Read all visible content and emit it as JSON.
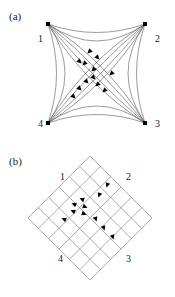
{
  "figure": {
    "background_color": "#ffffff",
    "stroke_color": "#555555",
    "marker_color": "#000000",
    "text_color": "#1a1a1a"
  },
  "panels": [
    {
      "id": "a",
      "caption": "(a)",
      "description": "complete-graph-curved-arcs",
      "node_labels": [
        {
          "name": "1",
          "x": 38,
          "y": 34
        },
        {
          "name": "2",
          "x": 155,
          "y": 34
        },
        {
          "name": "3",
          "x": 155,
          "y": 119
        },
        {
          "name": "4",
          "x": 38,
          "y": 119
        }
      ]
    },
    {
      "id": "b",
      "caption": "(b)",
      "description": "rotated-square-lattice-grid",
      "node_labels": [
        {
          "name": "1",
          "x": 60,
          "y": 24
        },
        {
          "name": "2",
          "x": 126,
          "y": 24
        },
        {
          "name": "3",
          "x": 126,
          "y": 106
        },
        {
          "name": "4",
          "x": 58,
          "y": 106
        }
      ]
    }
  ],
  "chart_data": {
    "type": "diagram",
    "title": "",
    "panel_a": {
      "type": "graph-with-curved-edges",
      "nodes": [
        {
          "id": 1,
          "label": "1",
          "x": 48,
          "y": 24
        },
        {
          "id": 2,
          "label": "2",
          "x": 145,
          "y": 24
        },
        {
          "id": 3,
          "label": "3",
          "x": 145,
          "y": 123
        },
        {
          "id": 4,
          "label": "4",
          "x": 48,
          "y": 123
        }
      ],
      "edge_curvature": 0.34,
      "curve_bundles": [
        {
          "from": 1,
          "to": 3,
          "count": 4
        },
        {
          "from": 2,
          "to": 4,
          "count": 4
        },
        {
          "from": 1,
          "to": 2,
          "count": 2
        },
        {
          "from": 4,
          "to": 3,
          "count": 2
        },
        {
          "from": 1,
          "to": 4,
          "count": 2
        },
        {
          "from": 2,
          "to": 3,
          "count": 2
        }
      ],
      "markers": [
        {
          "x": 91,
          "y": 50,
          "type": "arrowhead"
        },
        {
          "x": 78,
          "y": 60,
          "type": "arrowhead"
        },
        {
          "x": 86,
          "y": 62,
          "type": "arrowhead"
        },
        {
          "x": 96,
          "y": 56,
          "type": "arrowhead"
        },
        {
          "x": 95,
          "y": 68,
          "type": "arrowhead"
        },
        {
          "x": 92,
          "y": 76,
          "type": "arrowhead"
        },
        {
          "x": 85,
          "y": 80,
          "type": "arrowhead"
        },
        {
          "x": 99,
          "y": 83,
          "type": "arrowhead"
        },
        {
          "x": 78,
          "y": 87,
          "type": "arrowhead"
        },
        {
          "x": 106,
          "y": 89,
          "type": "arrowhead"
        },
        {
          "x": 72,
          "y": 95,
          "type": "arrowhead"
        },
        {
          "x": 113,
          "y": 72,
          "type": "arrowhead"
        }
      ]
    },
    "panel_b": {
      "type": "rotated-lattice",
      "center_x": 90,
      "center_y": 70,
      "half_diagonal": 62,
      "divisions": 6,
      "rotation_deg": 45,
      "markers": [
        {
          "x": 108,
          "y": 35,
          "type": "arrowhead"
        },
        {
          "x": 100,
          "y": 45,
          "type": "arrowhead"
        },
        {
          "x": 84,
          "y": 52,
          "type": "arrowhead"
        },
        {
          "x": 76,
          "y": 57,
          "type": "arrowhead"
        },
        {
          "x": 83,
          "y": 58,
          "type": "arrowhead"
        },
        {
          "x": 75,
          "y": 64,
          "type": "arrowhead"
        },
        {
          "x": 82,
          "y": 65,
          "type": "arrowhead"
        },
        {
          "x": 66,
          "y": 72,
          "type": "arrowhead"
        },
        {
          "x": 95,
          "y": 69,
          "type": "arrowhead"
        },
        {
          "x": 103,
          "y": 78,
          "type": "arrowhead"
        },
        {
          "x": 112,
          "y": 87,
          "type": "arrowhead"
        }
      ]
    }
  }
}
